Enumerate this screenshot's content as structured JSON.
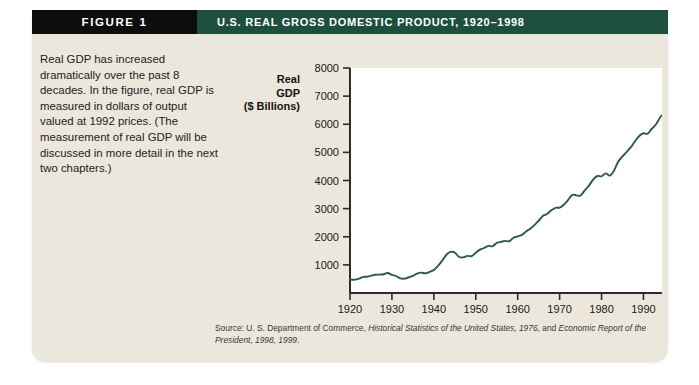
{
  "header": {
    "figure_label": "FIGURE 1",
    "title": "U.S. Real Gross Domestic Product, 1920–1998"
  },
  "description": {
    "text": "Real GDP has increased dramatically over the past 8 decades. In the figure, real GDP is measured in dollars of output valued at 1992 prices. (The measurement of real GDP will be discussed in more detail in the next two chapters.)"
  },
  "source": {
    "prefix": "Source: U. S. Department of Commerce, ",
    "italic1": "Historical Statistics of the United States, 1976",
    "middle": ", and ",
    "italic2": "Economic Report of the President, 1998, 1999",
    "suffix": "."
  },
  "colors": {
    "card_background": "#ece7dc",
    "header_green": "#1d4f3e",
    "header_black": "#0d0d0d",
    "line": "#2a5a4a",
    "plot_background": "#ffffff",
    "axis": "#2b2b2b"
  },
  "chart_data": {
    "type": "line",
    "title": "U.S. Real Gross Domestic Product, 1920–1998",
    "xlabel": "Year",
    "ylabel": "Real GDP ($ Billions)",
    "ylabel_lines": [
      "Real",
      "GDP",
      "($ Billions)"
    ],
    "xlim": [
      1920,
      1998
    ],
    "ylim": [
      0,
      8000
    ],
    "grid": false,
    "legend": null,
    "ytick_labels": [
      "1000",
      "2000",
      "3000",
      "4000",
      "5000",
      "6000",
      "7000",
      "8000"
    ],
    "yticks": [
      1000,
      2000,
      3000,
      4000,
      5000,
      6000,
      7000,
      8000
    ],
    "xtick_labels": [
      "1920",
      "1930",
      "1940",
      "1950",
      "1960",
      "1970",
      "1980",
      "1990",
      "1998"
    ],
    "xticks": [
      1920,
      1930,
      1940,
      1950,
      1960,
      1970,
      1980,
      1990,
      1998
    ],
    "series": [
      {
        "name": "Real GDP (1992 dollars, $ Billions)",
        "x": [
          1920,
          1921,
          1922,
          1923,
          1924,
          1925,
          1926,
          1927,
          1928,
          1929,
          1930,
          1931,
          1932,
          1933,
          1934,
          1935,
          1936,
          1937,
          1938,
          1939,
          1940,
          1941,
          1942,
          1943,
          1944,
          1945,
          1946,
          1947,
          1948,
          1949,
          1950,
          1951,
          1952,
          1953,
          1954,
          1955,
          1956,
          1957,
          1958,
          1959,
          1960,
          1961,
          1962,
          1963,
          1964,
          1965,
          1966,
          1967,
          1968,
          1969,
          1970,
          1971,
          1972,
          1973,
          1974,
          1975,
          1976,
          1977,
          1978,
          1979,
          1980,
          1981,
          1982,
          1983,
          1984,
          1985,
          1986,
          1987,
          1988,
          1989,
          1990,
          1991,
          1992,
          1993,
          1994,
          1995,
          1996,
          1997,
          1998
        ],
        "y": [
          480,
          470,
          500,
          565,
          580,
          610,
          650,
          655,
          665,
          710,
          645,
          600,
          520,
          510,
          560,
          610,
          690,
          725,
          700,
          755,
          820,
          965,
          1150,
          1360,
          1460,
          1440,
          1280,
          1265,
          1320,
          1310,
          1430,
          1545,
          1600,
          1675,
          1660,
          1780,
          1820,
          1855,
          1840,
          1965,
          2015,
          2065,
          2190,
          2285,
          2415,
          2570,
          2740,
          2810,
          2940,
          3030,
          3035,
          3135,
          3300,
          3490,
          3470,
          3465,
          3650,
          3820,
          4030,
          4160,
          4150,
          4255,
          4175,
          4360,
          4675,
          4855,
          5020,
          5185,
          5400,
          5580,
          5680,
          5665,
          5840,
          6000,
          6250,
          6410,
          6640,
          6930,
          7220
        ],
        "end_value_label": "7650"
      }
    ]
  }
}
